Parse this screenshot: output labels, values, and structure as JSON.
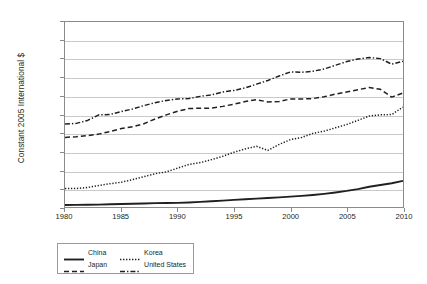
{
  "chart_data": {
    "type": "line",
    "title": "",
    "xlabel": "",
    "ylabel": "Constant 2005 International $",
    "xlim": [
      1980,
      2010
    ],
    "ylim": [
      0,
      50000
    ],
    "grid": "horizontal",
    "legend_position": "bottom-left",
    "y_ticks": [
      "0",
      "5,000",
      "10,000",
      "15,000",
      "20,000",
      "25,000",
      "30,000",
      "35,000",
      "40,000",
      "45,000",
      "50,000"
    ],
    "y_tick_values": [
      0,
      5000,
      10000,
      15000,
      20000,
      25000,
      30000,
      35000,
      40000,
      45000,
      50000
    ],
    "x_ticks": [
      "1980",
      "1985",
      "1990",
      "1995",
      "2000",
      "2005",
      "2010"
    ],
    "x_tick_values": [
      1980,
      1985,
      1990,
      1995,
      2000,
      2005,
      2010
    ],
    "x": [
      1980,
      1981,
      1982,
      1983,
      1984,
      1985,
      1986,
      1987,
      1988,
      1989,
      1990,
      1991,
      1992,
      1993,
      1994,
      1995,
      1996,
      1997,
      1998,
      1999,
      2000,
      2001,
      2002,
      2003,
      2004,
      2005,
      2006,
      2007,
      2008,
      2009,
      2010
    ],
    "series": [
      {
        "name": "China",
        "style": "solid",
        "color": "#231f20",
        "values": [
          530,
          560,
          600,
          650,
          730,
          820,
          880,
          960,
          1050,
          1080,
          1120,
          1220,
          1370,
          1540,
          1730,
          1910,
          2090,
          2270,
          2420,
          2590,
          2790,
          3000,
          3250,
          3560,
          3930,
          4350,
          4850,
          5480,
          5950,
          6420,
          7050
        ]
      },
      {
        "name": "Korea",
        "style": "dotted",
        "color": "#231f20",
        "values": [
          5000,
          5000,
          5250,
          5800,
          6300,
          6700,
          7400,
          8200,
          9000,
          9500,
          10500,
          11500,
          12000,
          12800,
          13700,
          14800,
          15700,
          16400,
          15300,
          16900,
          18200,
          18800,
          19900,
          20500,
          21400,
          22300,
          23400,
          24600,
          24900,
          25000,
          27000
        ]
      },
      {
        "name": "Japan",
        "style": "dashed",
        "color": "#231f20",
        "values": [
          18800,
          19000,
          19300,
          19700,
          20400,
          21200,
          21700,
          22500,
          23800,
          24900,
          25900,
          26600,
          26700,
          26700,
          27200,
          27800,
          28500,
          29000,
          28400,
          28500,
          29200,
          29200,
          29300,
          29800,
          30500,
          31100,
          31700,
          32300,
          31800,
          29700,
          30800
        ]
      },
      {
        "name": "United States",
        "style": "dash-dot",
        "color": "#231f20",
        "values": [
          22400,
          22600,
          23400,
          24900,
          25000,
          25800,
          26500,
          27400,
          28200,
          28800,
          29200,
          29300,
          29900,
          30300,
          31100,
          31500,
          32200,
          33200,
          34200,
          35400,
          36500,
          36400,
          36700,
          37300,
          38300,
          39300,
          40000,
          40400,
          40100,
          38600,
          39400
        ]
      }
    ]
  },
  "legend": {
    "items": [
      {
        "label": "China",
        "style": "solid"
      },
      {
        "label": "Korea",
        "style": "dotted"
      },
      {
        "label": "Japan",
        "style": "dashed"
      },
      {
        "label": "United States",
        "style": "dash-dot"
      }
    ]
  }
}
